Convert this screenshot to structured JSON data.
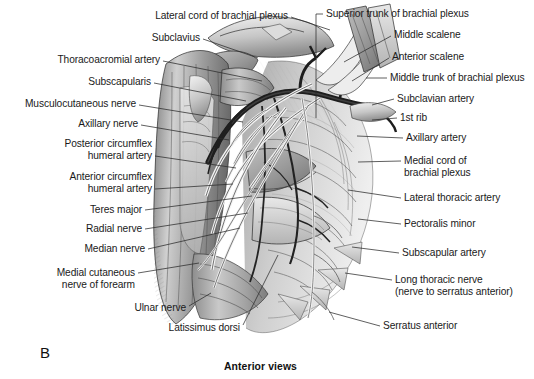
{
  "figure": {
    "panel_letter": "B",
    "caption": "Anterior views",
    "style": "grayscale-pen-and-ink"
  },
  "labels_left": [
    {
      "id": "lateral-cord-of-brachial-plexus",
      "line1": "Lateral cord of brachial plexus",
      "line2": "",
      "text_x": 288,
      "text_y": 16,
      "leader": [
        [
          291,
          17
        ],
        [
          330,
          30
        ]
      ]
    },
    {
      "id": "subclavius",
      "line1": "Subclavius",
      "line2": "",
      "text_x": 200,
      "text_y": 38,
      "leader": [
        [
          203,
          39
        ],
        [
          258,
          58
        ]
      ]
    },
    {
      "id": "thoracoacromial-artery",
      "line1": "Thoracoacromial artery",
      "line2": "",
      "text_x": 160,
      "text_y": 60,
      "leader": [
        [
          163,
          61
        ],
        [
          262,
          81
        ]
      ]
    },
    {
      "id": "subscapularis",
      "line1": "Subscapularis",
      "line2": "",
      "text_x": 151,
      "text_y": 82,
      "leader": [
        [
          154,
          83
        ],
        [
          246,
          101
        ]
      ]
    },
    {
      "id": "musculocutaneous-nerve",
      "line1": "Musculocutaneous nerve",
      "line2": "",
      "text_x": 136,
      "text_y": 104,
      "leader": [
        [
          139,
          105
        ],
        [
          243,
          122
        ]
      ]
    },
    {
      "id": "axillary-nerve",
      "line1": "Axillary nerve",
      "line2": "",
      "text_x": 138,
      "text_y": 124,
      "leader": [
        [
          141,
          125
        ],
        [
          229,
          140
        ]
      ]
    },
    {
      "id": "posterior-circumflex-humeral-artery",
      "line1": "Posterior circumflex",
      "line2": "humeral artery",
      "text_x": 152,
      "text_y": 150,
      "leader": [
        [
          155,
          156
        ],
        [
          236,
          168
        ]
      ]
    },
    {
      "id": "anterior-circumflex-humeral-artery",
      "line1": "Anterior circumflex",
      "line2": "humeral artery",
      "text_x": 152,
      "text_y": 183,
      "leader": [
        [
          155,
          189
        ],
        [
          233,
          184
        ]
      ]
    },
    {
      "id": "teres-major",
      "line1": "Teres major",
      "line2": "",
      "text_x": 142,
      "text_y": 210,
      "leader": [
        [
          145,
          210
        ],
        [
          252,
          196
        ]
      ]
    },
    {
      "id": "radial-nerve",
      "line1": "Radial nerve",
      "line2": "",
      "text_x": 142,
      "text_y": 229,
      "leader": [
        [
          145,
          229
        ],
        [
          248,
          213
        ]
      ]
    },
    {
      "id": "median-nerve",
      "line1": "Median nerve",
      "line2": "",
      "text_x": 145,
      "text_y": 249,
      "leader": [
        [
          148,
          249
        ],
        [
          240,
          228
        ]
      ]
    },
    {
      "id": "medial-cutaneous-nerve-of-forearm",
      "line1": "Medial cutaneous",
      "line2": "nerve of forearm",
      "text_x": 135,
      "text_y": 279,
      "leader": [
        [
          138,
          273
        ],
        [
          199,
          263
        ]
      ]
    },
    {
      "id": "ulnar-nerve",
      "line1": "Ulnar nerve",
      "line2": "",
      "text_x": 186,
      "text_y": 308,
      "leader": [
        [
          189,
          306
        ],
        [
          211,
          293
        ]
      ]
    },
    {
      "id": "latissimus-dorsi",
      "line1": "Latissimus dorsi",
      "line2": "",
      "text_x": 240,
      "text_y": 328,
      "leader": [
        [
          243,
          325
        ],
        [
          278,
          255
        ]
      ]
    }
  ],
  "labels_right": [
    {
      "id": "superior-trunk-of-brachial-plexus",
      "line1": "Superior trunk of brachial plexus",
      "line2": "",
      "text_x": 326,
      "text_y": 14,
      "leader": [
        [
          323,
          14
        ],
        [
          316,
          14
        ],
        [
          316,
          118
        ]
      ]
    },
    {
      "id": "middle-scalene",
      "line1": "Middle scalene",
      "line2": "",
      "text_x": 394,
      "text_y": 35,
      "leader": [
        [
          391,
          36
        ],
        [
          344,
          62
        ]
      ]
    },
    {
      "id": "anterior-scalene",
      "line1": "Anterior scalene",
      "line2": "",
      "text_x": 392,
      "text_y": 57,
      "leader": [
        [
          389,
          58
        ],
        [
          352,
          81
        ]
      ]
    },
    {
      "id": "middle-trunk-of-brachial-plexus",
      "line1": "Middle trunk of brachial plexus",
      "line2": "",
      "text_x": 390,
      "text_y": 78,
      "leader": [
        [
          387,
          78
        ],
        [
          366,
          78
        ]
      ]
    },
    {
      "id": "subclavian-artery",
      "line1": "Subclavian artery",
      "line2": "",
      "text_x": 397,
      "text_y": 99,
      "leader": [
        [
          394,
          99
        ],
        [
          372,
          105
        ]
      ]
    },
    {
      "id": "first-rib",
      "line1": "1st rib",
      "line2": "",
      "text_x": 400,
      "text_y": 118,
      "leader": [
        [
          397,
          118
        ],
        [
          372,
          120
        ]
      ]
    },
    {
      "id": "axillary-artery",
      "line1": "Axillary artery",
      "line2": "",
      "text_x": 406,
      "text_y": 138,
      "leader": [
        [
          403,
          138
        ],
        [
          357,
          136
        ]
      ]
    },
    {
      "id": "medial-cord-of-brachial-plexus",
      "line1": "Medial cord of",
      "line2": "brachial plexus",
      "text_x": 404,
      "text_y": 167,
      "leader": [
        [
          401,
          161
        ],
        [
          358,
          162
        ]
      ]
    },
    {
      "id": "lateral-thoracic-artery",
      "line1": "Lateral thoracic artery",
      "line2": "",
      "text_x": 404,
      "text_y": 198,
      "leader": [
        [
          401,
          198
        ],
        [
          348,
          190
        ]
      ]
    },
    {
      "id": "pectoralis-minor",
      "line1": "Pectoralis minor",
      "line2": "",
      "text_x": 404,
      "text_y": 224,
      "leader": [
        [
          401,
          224
        ],
        [
          358,
          219
        ]
      ]
    },
    {
      "id": "subscapular-artery",
      "line1": "Subscapular artery",
      "line2": "",
      "text_x": 402,
      "text_y": 253,
      "leader": [
        [
          399,
          253
        ],
        [
          352,
          247
        ]
      ]
    },
    {
      "id": "long-thoracic-nerve",
      "line1": "Long thoracic nerve",
      "line2": "(nerve to serratus anterior)",
      "text_x": 395,
      "text_y": 286,
      "leader": [
        [
          392,
          280
        ],
        [
          345,
          273
        ]
      ]
    },
    {
      "id": "serratus-anterior",
      "line1": "Serratus anterior",
      "line2": "",
      "text_x": 383,
      "text_y": 326,
      "leader": [
        [
          380,
          326
        ],
        [
          329,
          312
        ]
      ]
    }
  ]
}
